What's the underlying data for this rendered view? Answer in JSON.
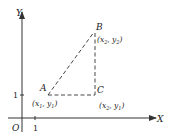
{
  "diagram": {
    "axes": {
      "x_label": "X",
      "y_label": "Y",
      "origin_label": "O",
      "x_tick_label": "1",
      "y_tick_label": "1"
    },
    "points": {
      "A": {
        "name": "A",
        "coords_main": "(x",
        "sub1": "1",
        "mid": ", y",
        "sub2": "1",
        "close": ")"
      },
      "B": {
        "name": "B",
        "coords_main": "(x",
        "sub1": "2",
        "mid": ", y",
        "sub2": "2",
        "close": ")"
      },
      "C": {
        "name": "C",
        "coords_main": "(x",
        "sub1": "2",
        "mid": ", y",
        "sub2": "1",
        "close": ")"
      }
    },
    "colors": {
      "line": "#333333",
      "background": "#ffffff"
    }
  }
}
